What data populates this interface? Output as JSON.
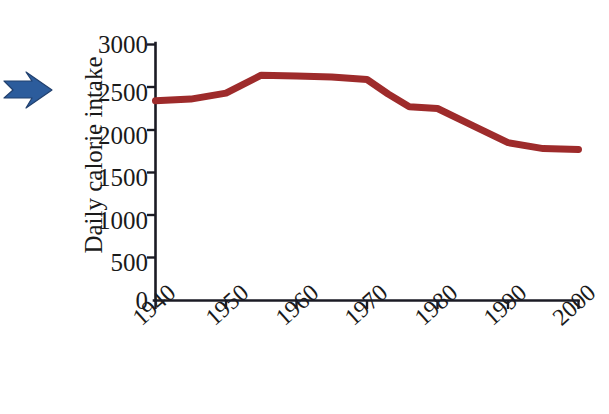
{
  "figure": {
    "background_color": "#ffffff",
    "annotation_arrow": {
      "name": "pointer-arrow",
      "direction": "right",
      "color": "#2c5c9c"
    }
  },
  "chart_data": {
    "type": "line",
    "title": "",
    "subtitle": "",
    "xlabel": "Year",
    "ylabel": "Daily calorie intake",
    "xlim": [
      1940,
      2000
    ],
    "ylim": [
      0,
      3000
    ],
    "grid": false,
    "legend": null,
    "legend_position": "none",
    "line_color": "#9e2b2b",
    "line_width_px": 7,
    "x_tick_labels": [
      "1940",
      "1950",
      "1960",
      "1970",
      "1980",
      "1990",
      "2000"
    ],
    "x_ticks": [
      1940,
      1950,
      1960,
      1970,
      1980,
      1990,
      2000
    ],
    "y_tick_labels": [
      "0",
      "500",
      "1000",
      "1500",
      "2000",
      "2500",
      "3000"
    ],
    "y_ticks": [
      0,
      500,
      1000,
      1500,
      2000,
      2500,
      3000
    ],
    "series": [
      {
        "name": "Daily calorie intake",
        "x": [
          1940,
          1945,
          1950,
          1955,
          1960,
          1965,
          1970,
          1973,
          1976,
          1980,
          1985,
          1990,
          1995,
          2000
        ],
        "values": [
          2340,
          2360,
          2430,
          2640,
          2630,
          2620,
          2590,
          2420,
          2270,
          2250,
          2050,
          1850,
          1780,
          1770
        ]
      }
    ]
  }
}
